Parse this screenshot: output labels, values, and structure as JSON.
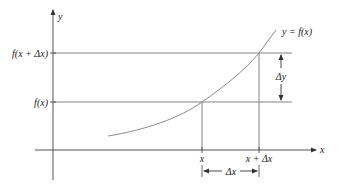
{
  "diagram": {
    "colors": {
      "axis": "#555555",
      "guide": "#777777",
      "curve": "#8a8a8a",
      "text": "#222222"
    },
    "axes": {
      "x_label": "x",
      "y_label": "y"
    },
    "curve_label": "y = f(x)",
    "y_ticks": [
      {
        "label": "f(x + Δx)"
      },
      {
        "label": "f(x)"
      }
    ],
    "x_ticks": [
      {
        "label": "x"
      },
      {
        "label": "x + Δx"
      }
    ],
    "dimension_labels": {
      "delta_y": "Δy",
      "delta_x": "Δx"
    }
  }
}
